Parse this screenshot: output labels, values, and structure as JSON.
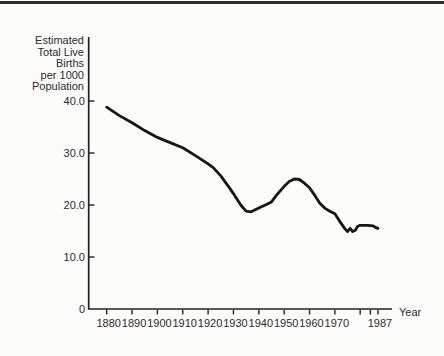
{
  "page": {
    "background_color": "#fcfcfa",
    "top_edge_color": "#2d2d2d"
  },
  "chart_data": {
    "type": "line",
    "title": "Estimated Total Live Births per 1000 Population",
    "title_lines": [
      "Estimated",
      "Total Live",
      "Births",
      "per 1000",
      "Population"
    ],
    "xlabel": "Year",
    "ylabel": "",
    "xlim": [
      1880,
      1992
    ],
    "ylim": [
      0,
      52
    ],
    "grid": false,
    "legend": false,
    "line_color": "#161616",
    "axis_color": "#232323",
    "text_color": "#2b2b2b",
    "y_ticks": [
      {
        "value": 0,
        "label": "0"
      },
      {
        "value": 10,
        "label": "10.0"
      },
      {
        "value": 20,
        "label": "20.0"
      },
      {
        "value": 30,
        "label": "30.0"
      },
      {
        "value": 40,
        "label": "40.0"
      }
    ],
    "x_ticks": [
      {
        "year": 1880,
        "label": "1880"
      },
      {
        "year": 1890,
        "label": "1890"
      },
      {
        "year": 1900,
        "label": "1900"
      },
      {
        "year": 1910,
        "label": "1910"
      },
      {
        "year": 1920,
        "label": "1920"
      },
      {
        "year": 1930,
        "label": "1930"
      },
      {
        "year": 1940,
        "label": "1940"
      },
      {
        "year": 1950,
        "label": "1950"
      },
      {
        "year": 1960,
        "label": "1960"
      },
      {
        "year": 1970,
        "label": "1970"
      },
      {
        "year": 1980,
        "label": ""
      },
      {
        "year": 1984,
        "label": ""
      },
      {
        "year": 1987,
        "label": "1987"
      }
    ],
    "series": [
      {
        "name": "Estimated total live births per 1000 population",
        "x": [
          1880,
          1885,
          1890,
          1895,
          1900,
          1905,
          1910,
          1915,
          1920,
          1922,
          1925,
          1928,
          1930,
          1933,
          1935,
          1937,
          1940,
          1943,
          1945,
          1947,
          1950,
          1952,
          1954,
          1956,
          1958,
          1960,
          1962,
          1964,
          1966,
          1968,
          1970,
          1972,
          1974,
          1975,
          1976,
          1977,
          1978,
          1979,
          1980,
          1983,
          1985,
          1986,
          1987
        ],
        "y": [
          38.8,
          37.2,
          35.8,
          34.3,
          33.0,
          32.0,
          31.0,
          29.5,
          27.9,
          27.2,
          25.6,
          23.6,
          22.2,
          19.9,
          18.8,
          18.7,
          19.4,
          20.1,
          20.6,
          21.9,
          23.6,
          24.5,
          25.0,
          24.9,
          24.2,
          23.3,
          21.9,
          20.4,
          19.4,
          18.8,
          18.3,
          16.8,
          15.4,
          14.9,
          15.5,
          14.9,
          15.1,
          15.9,
          16.1,
          16.1,
          16.0,
          15.7,
          15.5
        ]
      }
    ]
  }
}
